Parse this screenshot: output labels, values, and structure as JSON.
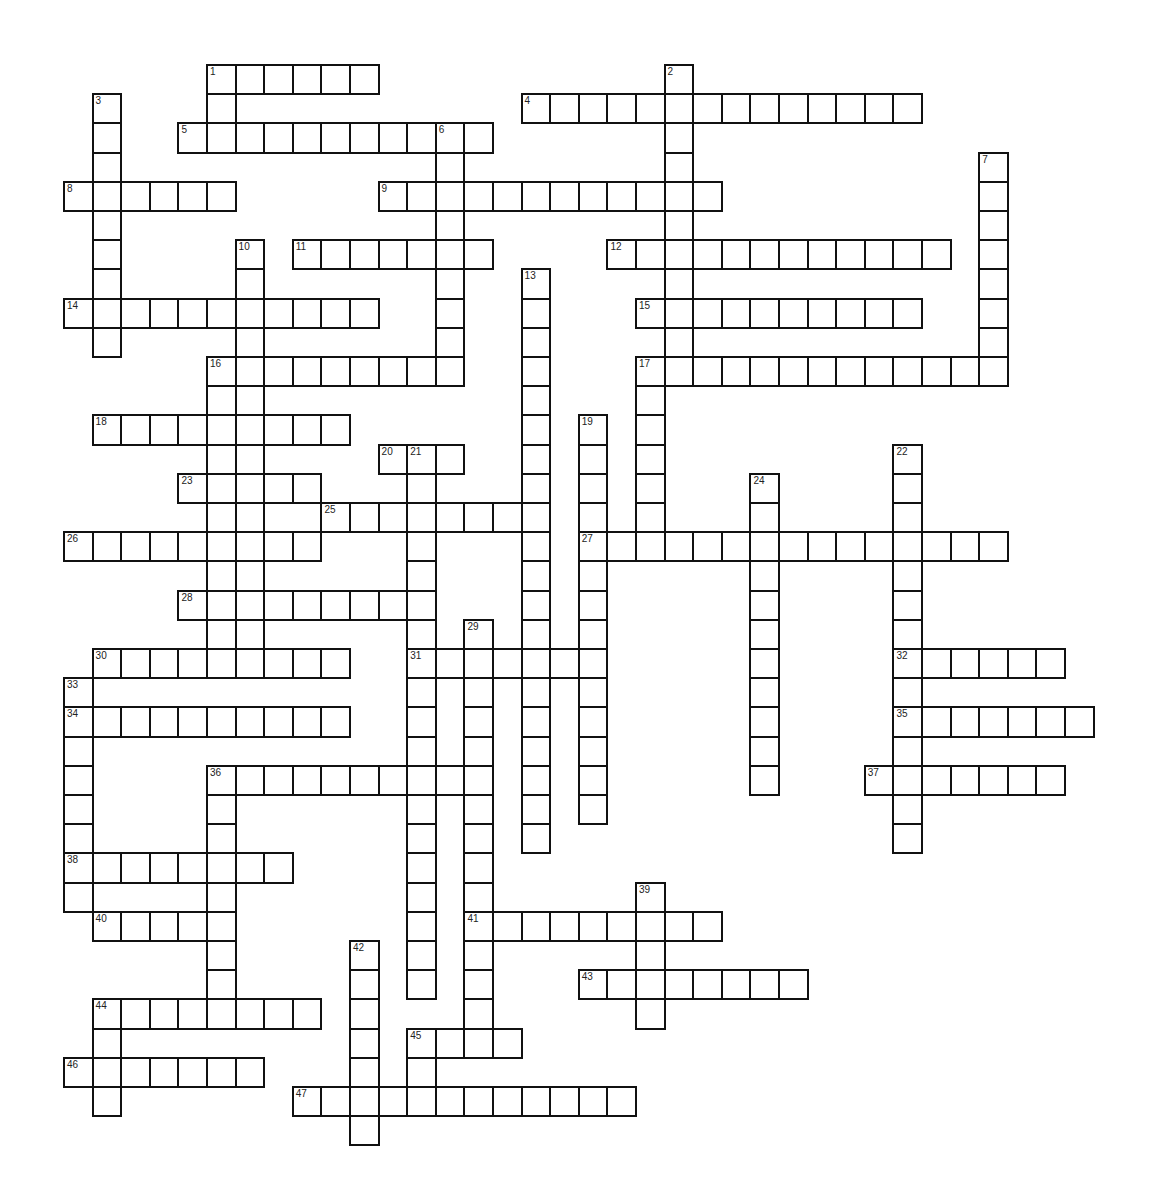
{
  "puzzle": {
    "title": "",
    "grid": {
      "origin_x": 63,
      "origin_y": 64,
      "cell_w": 28.6,
      "cell_h": 29.2,
      "border_color": "#111111",
      "cell_color": "#ffffff"
    },
    "across": [
      {
        "number": 1,
        "row": 0,
        "col": 5,
        "length": 6
      },
      {
        "number": 4,
        "row": 1,
        "col": 16,
        "length": 14
      },
      {
        "number": 5,
        "row": 2,
        "col": 4,
        "length": 11
      },
      {
        "number": 8,
        "row": 4,
        "col": 0,
        "length": 6
      },
      {
        "number": 9,
        "row": 4,
        "col": 11,
        "length": 12
      },
      {
        "number": 11,
        "row": 6,
        "col": 8,
        "length": 7
      },
      {
        "number": 12,
        "row": 6,
        "col": 19,
        "length": 12
      },
      {
        "number": 14,
        "row": 8,
        "col": 0,
        "length": 11
      },
      {
        "number": 15,
        "row": 8,
        "col": 20,
        "length": 10
      },
      {
        "number": 16,
        "row": 10,
        "col": 5,
        "length": 9
      },
      {
        "number": 17,
        "row": 10,
        "col": 20,
        "length": 13
      },
      {
        "number": 18,
        "row": 12,
        "col": 1,
        "length": 9
      },
      {
        "number": 20,
        "row": 13,
        "col": 11,
        "length": 3
      },
      {
        "number": 23,
        "row": 14,
        "col": 4,
        "length": 5
      },
      {
        "number": 25,
        "row": 15,
        "col": 9,
        "length": 8
      },
      {
        "number": 26,
        "row": 16,
        "col": 0,
        "length": 9
      },
      {
        "number": 27,
        "row": 16,
        "col": 18,
        "length": 15
      },
      {
        "number": 28,
        "row": 18,
        "col": 4,
        "length": 9
      },
      {
        "number": 30,
        "row": 20,
        "col": 1,
        "length": 9
      },
      {
        "number": 31,
        "row": 20,
        "col": 12,
        "length": 7
      },
      {
        "number": 32,
        "row": 20,
        "col": 29,
        "length": 6
      },
      {
        "number": 34,
        "row": 22,
        "col": 0,
        "length": 10
      },
      {
        "number": 35,
        "row": 22,
        "col": 29,
        "length": 7
      },
      {
        "number": 36,
        "row": 24,
        "col": 5,
        "length": 10
      },
      {
        "number": 37,
        "row": 24,
        "col": 28,
        "length": 7
      },
      {
        "number": 38,
        "row": 27,
        "col": 0,
        "length": 8
      },
      {
        "number": 40,
        "row": 29,
        "col": 1,
        "length": 5
      },
      {
        "number": 41,
        "row": 29,
        "col": 14,
        "length": 9
      },
      {
        "number": 43,
        "row": 31,
        "col": 18,
        "length": 8
      },
      {
        "number": 44,
        "row": 32,
        "col": 1,
        "length": 8
      },
      {
        "number": 45,
        "row": 33,
        "col": 12,
        "length": 4
      },
      {
        "number": 46,
        "row": 34,
        "col": 0,
        "length": 7
      },
      {
        "number": 47,
        "row": 35,
        "col": 8,
        "length": 12
      }
    ],
    "down": [
      {
        "number": 1,
        "row": 0,
        "col": 5,
        "length": 3
      },
      {
        "number": 2,
        "row": 0,
        "col": 21,
        "length": 11
      },
      {
        "number": 3,
        "row": 1,
        "col": 1,
        "length": 9
      },
      {
        "number": 6,
        "row": 2,
        "col": 13,
        "length": 9
      },
      {
        "number": 7,
        "row": 3,
        "col": 32,
        "length": 8
      },
      {
        "number": 10,
        "row": 6,
        "col": 6,
        "length": 15
      },
      {
        "number": 13,
        "row": 7,
        "col": 16,
        "length": 20
      },
      {
        "number": 16,
        "row": 10,
        "col": 5,
        "length": 11
      },
      {
        "number": 17,
        "row": 10,
        "col": 20,
        "length": 7
      },
      {
        "number": 19,
        "row": 12,
        "col": 18,
        "length": 14
      },
      {
        "number": 21,
        "row": 13,
        "col": 12,
        "length": 19
      },
      {
        "number": 22,
        "row": 13,
        "col": 29,
        "length": 14
      },
      {
        "number": 24,
        "row": 14,
        "col": 24,
        "length": 11
      },
      {
        "number": 29,
        "row": 19,
        "col": 14,
        "length": 15
      },
      {
        "number": 33,
        "row": 21,
        "col": 0,
        "length": 8
      },
      {
        "number": 36,
        "row": 24,
        "col": 5,
        "length": 9
      },
      {
        "number": 39,
        "row": 28,
        "col": 20,
        "length": 5
      },
      {
        "number": 42,
        "row": 30,
        "col": 10,
        "length": 7
      },
      {
        "number": 44,
        "row": 32,
        "col": 1,
        "length": 4
      },
      {
        "number": 45,
        "row": 33,
        "col": 12,
        "length": 3
      }
    ]
  }
}
